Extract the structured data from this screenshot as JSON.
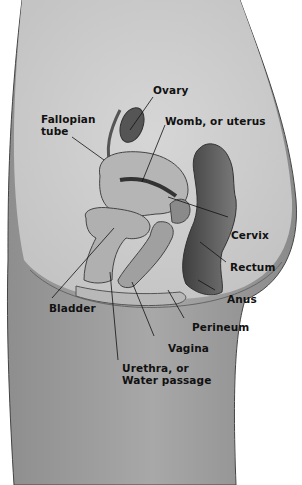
{
  "figure": {
    "type": "anatomical-diagram",
    "colors": {
      "background": "#ffffff",
      "body": "#9a9a9a",
      "pelvic_cavity": "#cfcfcf",
      "organ_light": "#bdbdbd",
      "organ_dark": "#4a4a4a",
      "text": "#111111"
    }
  },
  "labels": {
    "ovary": {
      "text": "Ovary"
    },
    "fallopian_tube": {
      "line1": "Fallopian",
      "line2": "tube"
    },
    "womb": {
      "text": "Womb, or uterus"
    },
    "cervix": {
      "text": "Cervix"
    },
    "rectum": {
      "text": "Rectum"
    },
    "anus": {
      "text": "Anus"
    },
    "bladder": {
      "text": "Bladder"
    },
    "perineum": {
      "text": "Perineum"
    },
    "vagina": {
      "text": "Vagina"
    },
    "urethra": {
      "line1": "Urethra, or",
      "line2": "Water passage"
    }
  }
}
